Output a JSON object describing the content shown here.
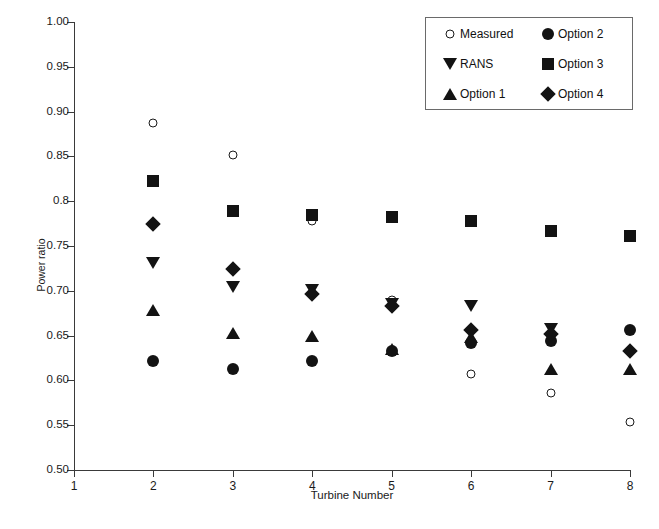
{
  "chart_data": {
    "type": "scatter",
    "title": "",
    "xlabel": "Turbine Number",
    "ylabel": "Power ratio",
    "xlim": [
      1,
      8
    ],
    "ylim": [
      0.5,
      1.0
    ],
    "grid": false,
    "legend_position": "top-right",
    "xticks": [
      "1",
      "2",
      "3",
      "4",
      "5",
      "6",
      "7",
      "8"
    ],
    "xtick_values": [
      1,
      2,
      3,
      4,
      5,
      6,
      7,
      8
    ],
    "yticks": [
      "0.50",
      "0.55",
      "0.60",
      "0.65",
      "0.70",
      "0.75",
      "0.8",
      "0.85",
      "0.90",
      "0.95",
      "1.00"
    ],
    "ytick_values": [
      0.5,
      0.55,
      0.6,
      0.65,
      0.7,
      0.75,
      0.8,
      0.85,
      0.9,
      0.95,
      1.0
    ],
    "x": [
      2,
      3,
      4,
      5,
      6,
      7,
      8
    ],
    "series": [
      {
        "name": "Measured",
        "marker": "circle-open",
        "values": [
          0.887,
          0.852,
          0.778,
          0.69,
          0.607,
          0.586,
          0.554
        ]
      },
      {
        "name": "RANS",
        "marker": "triangle-down",
        "values": [
          0.731,
          0.704,
          0.701,
          0.685,
          0.683,
          0.657,
          null
        ]
      },
      {
        "name": "Option 1",
        "marker": "triangle-up",
        "values": [
          0.679,
          0.653,
          0.649,
          0.635,
          0.648,
          0.613,
          0.613
        ]
      },
      {
        "name": "Option 2",
        "marker": "circle-filled",
        "values": [
          0.622,
          0.613,
          0.622,
          0.633,
          0.642,
          0.644,
          0.656
        ]
      },
      {
        "name": "Option 3",
        "marker": "square",
        "values": [
          0.823,
          0.789,
          0.785,
          0.782,
          0.778,
          0.767,
          0.761
        ]
      },
      {
        "name": "Option 4",
        "marker": "diamond",
        "values": [
          0.774,
          0.724,
          0.696,
          0.683,
          0.656,
          0.652,
          0.633
        ]
      }
    ],
    "marker_color": "#131313"
  },
  "legend": {
    "left_column": [
      "Measured",
      "RANS",
      "Option 1"
    ],
    "right_column": [
      "Option 2",
      "Option 3",
      "Option 4"
    ]
  }
}
